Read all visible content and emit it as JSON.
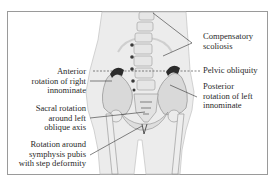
{
  "figure": {
    "type": "anatomical-diagram",
    "colors": {
      "frame": "#9a9a9a",
      "body": "#ececec",
      "bone": "#d6d6d6",
      "bone_light": "#f4f4f4",
      "bone_dark": "#2b2b2b",
      "leader": "#333333"
    }
  },
  "labels": {
    "left": [
      {
        "id": "anterior-rotation",
        "lines": [
          "Anterior",
          "rotation of right",
          "innominate"
        ]
      },
      {
        "id": "sacral-rotation",
        "lines": [
          "Sacral rotation",
          "around left",
          "oblique axis"
        ]
      },
      {
        "id": "symphysis-rotation",
        "lines": [
          "Rotation around",
          "symphysis pubis",
          "with step deformity"
        ]
      }
    ],
    "right": [
      {
        "id": "compensatory-scoliosis",
        "lines": [
          "Compensatory",
          "scoliosis"
        ]
      },
      {
        "id": "pelvic-obliquity",
        "lines": [
          "Pelvic obliquity"
        ]
      },
      {
        "id": "posterior-rotation",
        "lines": [
          "Posterior",
          "rotation of left",
          "innominate"
        ]
      }
    ]
  }
}
